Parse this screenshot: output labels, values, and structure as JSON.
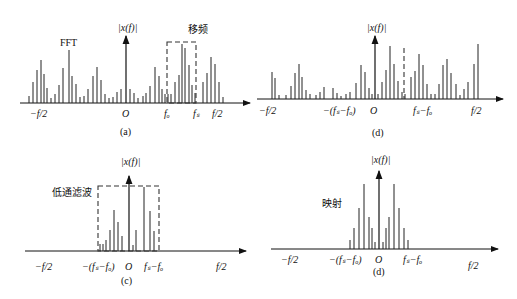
{
  "panels": [
    {
      "id": "a",
      "caption": "(a)",
      "y_label": "|x(f)|",
      "annotation_fft": "FFT",
      "annotation_box": "移频",
      "x_labels": [
        "−f/2",
        "O",
        "fₒ",
        "fₛ",
        "f/2"
      ],
      "bars": [
        5,
        14,
        21,
        25,
        18,
        10,
        4,
        6,
        14,
        22,
        29,
        18,
        14,
        4,
        5,
        11,
        18,
        23,
        16,
        7,
        4,
        4,
        7,
        9,
        9,
        6,
        4,
        3,
        5,
        6,
        6,
        12,
        22,
        17,
        9,
        6,
        6,
        14,
        19,
        32,
        30,
        21,
        12,
        6,
        16,
        26,
        29,
        14,
        3
      ]
    },
    {
      "id": "d1",
      "caption": "(d)",
      "y_label": "|x(f)|",
      "x_labels": [
        "−f/2",
        "−(fₛ−fₒ)",
        "O",
        "fₛ−fₒ",
        "f/2"
      ]
    },
    {
      "id": "c",
      "caption": "(c)",
      "y_label": "|x(f)|",
      "annotation_box": "低通滤波",
      "x_labels": [
        "−f/2",
        "−(fₛ−fₒ)",
        "O",
        "fₛ−fₒ",
        "f/2"
      ]
    },
    {
      "id": "d2",
      "caption": "(d)",
      "y_label": "|x(f)|",
      "annotation": "映射",
      "x_labels": [
        "−f/2",
        "−(fₛ−fₒ)",
        "O",
        "fₛ−fₒ",
        "f/2"
      ]
    }
  ]
}
